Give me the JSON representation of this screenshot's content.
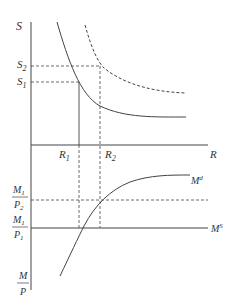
{
  "diagram": {
    "upper_panel": {
      "y_axis_label": "S",
      "x_axis_label": "R",
      "y_ticks": [
        {
          "label": "S",
          "sub": "2"
        },
        {
          "label": "S",
          "sub": "1"
        }
      ],
      "x_ticks": [
        {
          "label": "R",
          "sub": "1"
        },
        {
          "label": "R",
          "sub": "2"
        }
      ],
      "curves": [
        {
          "name": "initial curve",
          "style": "solid"
        },
        {
          "name": "shifted curve",
          "style": "dashed"
        }
      ]
    },
    "lower_panel": {
      "y_axis_label": {
        "num": "M",
        "den": "P"
      },
      "levels": [
        {
          "num": "M",
          "num_sub": "1",
          "den": "P",
          "den_sub": "2",
          "style": "dashed"
        },
        {
          "num": "M",
          "num_sub": "1",
          "den": "P",
          "den_sub": "1",
          "style": "solid"
        }
      ],
      "demand_label": {
        "base": "M",
        "sup": "d"
      },
      "supply_label": {
        "base": "M",
        "sup": "S"
      }
    },
    "colors": {
      "line": "#444444",
      "text": "#333333"
    }
  }
}
